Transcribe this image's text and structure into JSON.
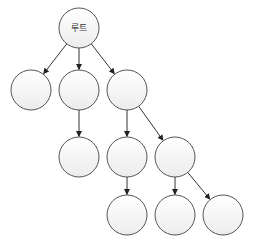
{
  "diagram": {
    "type": "tree",
    "colors": {
      "edge": "#333333",
      "node_stroke": "#555555",
      "node_fill_top": "#ffffff",
      "node_fill_bottom": "#eeeeee",
      "label": "#333333"
    },
    "nodes": [
      {
        "id": "root",
        "label": "루트",
        "cx": 79,
        "cy": 28
      },
      {
        "id": "a",
        "label": "",
        "cx": 31,
        "cy": 90
      },
      {
        "id": "b",
        "label": "",
        "cx": 79,
        "cy": 90
      },
      {
        "id": "c",
        "label": "",
        "cx": 127,
        "cy": 90
      },
      {
        "id": "b1",
        "label": "",
        "cx": 79,
        "cy": 157
      },
      {
        "id": "c1",
        "label": "",
        "cx": 127,
        "cy": 157
      },
      {
        "id": "c2",
        "label": "",
        "cx": 175,
        "cy": 157
      },
      {
        "id": "c1a",
        "label": "",
        "cx": 127,
        "cy": 215
      },
      {
        "id": "c2a",
        "label": "",
        "cx": 175,
        "cy": 215
      },
      {
        "id": "c2b",
        "label": "",
        "cx": 223,
        "cy": 215
      }
    ],
    "edges": [
      {
        "from": "root",
        "to": "a"
      },
      {
        "from": "root",
        "to": "b"
      },
      {
        "from": "root",
        "to": "c"
      },
      {
        "from": "b",
        "to": "b1"
      },
      {
        "from": "c",
        "to": "c1"
      },
      {
        "from": "c",
        "to": "c2"
      },
      {
        "from": "c1",
        "to": "c1a"
      },
      {
        "from": "c2",
        "to": "c2a"
      },
      {
        "from": "c2",
        "to": "c2b"
      }
    ]
  }
}
